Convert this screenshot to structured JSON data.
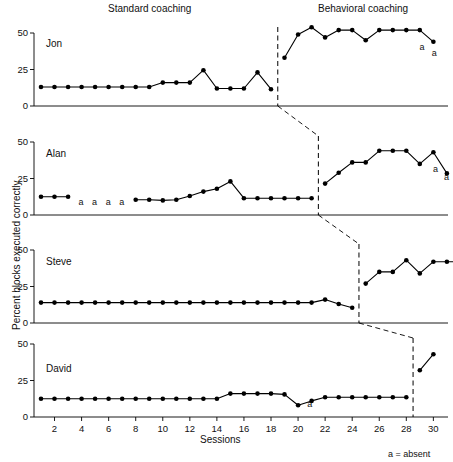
{
  "figure": {
    "phase_titles": [
      {
        "label": "Standard coaching",
        "x": 108,
        "y": 4
      },
      {
        "label": "Behavioral coaching",
        "x": 318,
        "y": 4
      }
    ],
    "y_axis_label": "Percent blocks executed correctly",
    "x_axis_label": "Sessions",
    "legend_note": "a = absent",
    "y_ticks": [
      "0",
      "25",
      "50"
    ],
    "x_ticks": [
      "2",
      "4",
      "6",
      "8",
      "10",
      "12",
      "14",
      "16",
      "18",
      "20",
      "22",
      "24",
      "26",
      "28",
      "30"
    ],
    "colors": {
      "ink": "#000000",
      "background": "#ffffff"
    }
  },
  "chart_data": {
    "type": "line",
    "title": "",
    "xlabel": "Sessions",
    "ylabel": "Percent blocks executed correctly",
    "xlim": [
      0.5,
      30.8
    ],
    "ylim": [
      0,
      55
    ],
    "y_ticks": [
      0,
      25,
      50
    ],
    "x_ticks": [
      2,
      4,
      6,
      8,
      10,
      12,
      14,
      16,
      18,
      20,
      22,
      24,
      26,
      28,
      30
    ],
    "grid": false,
    "legend": "none",
    "design": "multiple-baseline across participants",
    "phases": [
      "Standard coaching",
      "Behavioral coaching"
    ],
    "absent_legend": "a = absent",
    "panels": [
      {
        "name": "Jon",
        "phase_change_x": 18.5,
        "baseline": {
          "x": [
            1,
            2,
            3,
            4,
            5,
            6,
            7,
            8,
            9,
            10,
            11,
            12,
            13,
            14,
            15,
            16,
            17,
            18
          ],
          "y": [
            13,
            13,
            13,
            13,
            13,
            13,
            13,
            13,
            13,
            16,
            16,
            16,
            24.5,
            12,
            12,
            12,
            23,
            11.5
          ]
        },
        "treatment": {
          "x": [
            19,
            20,
            21,
            22,
            23,
            24,
            25,
            26,
            27,
            28,
            29,
            30
          ],
          "y": [
            33,
            49,
            54,
            47,
            52,
            52,
            45,
            52,
            52,
            52,
            52,
            44
          ]
        },
        "absent_marks": [
          {
            "x": 29.2,
            "label": "a"
          },
          {
            "x": 30.1,
            "label": "a"
          }
        ]
      },
      {
        "name": "Alan",
        "phase_change_x": 21.5,
        "baseline": {
          "x": [
            1,
            2,
            3,
            8,
            9,
            10,
            11,
            12,
            13,
            14,
            15,
            16,
            17,
            18,
            19,
            20,
            21
          ],
          "y": [
            12.5,
            12.5,
            12.5,
            10.5,
            10.5,
            10,
            10.5,
            13,
            16,
            18,
            23,
            11.5,
            11.5,
            11.5,
            11.5,
            11.5,
            11.5
          ]
        },
        "treatment": {
          "x": [
            22,
            23,
            24,
            25,
            26,
            27,
            28,
            29,
            30
          ],
          "y": [
            21.5,
            29,
            36,
            36,
            44,
            44,
            44,
            35,
            43
          ]
        },
        "tail": {
          "x": [
            30,
            31
          ],
          "y": [
            43,
            28.5
          ]
        },
        "absent_marks": [
          {
            "x": 4,
            "label": "a"
          },
          {
            "x": 5,
            "label": "a"
          },
          {
            "x": 6,
            "label": "a"
          },
          {
            "x": 7,
            "label": "a"
          },
          {
            "x": 30.2,
            "label": "a"
          },
          {
            "x": 31.0,
            "label": "a"
          }
        ]
      },
      {
        "name": "Steve",
        "phase_change_x": 24.5,
        "baseline": {
          "x": [
            1,
            2,
            3,
            4,
            5,
            6,
            7,
            8,
            9,
            10,
            11,
            12,
            13,
            14,
            15,
            16,
            17,
            18,
            19,
            20,
            21,
            22,
            23,
            24
          ],
          "y": [
            14,
            14,
            14,
            14,
            14,
            14,
            14,
            14,
            14,
            14,
            14,
            14,
            14,
            14,
            14,
            14,
            14,
            14,
            14,
            14,
            14,
            16,
            13,
            10.5
          ]
        },
        "treatment": {
          "x": [
            25,
            26,
            27,
            28,
            29,
            30,
            31,
            32
          ],
          "y": [
            27,
            35,
            35,
            43,
            34,
            42,
            42,
            42
          ]
        },
        "absent_marks": []
      },
      {
        "name": "David",
        "phase_change_x": 28.5,
        "baseline": {
          "x": [
            1,
            2,
            3,
            4,
            5,
            6,
            7,
            8,
            9,
            10,
            11,
            12,
            13,
            14,
            15,
            16,
            17,
            18,
            19,
            20,
            21,
            22,
            23,
            24,
            25,
            26,
            27,
            28
          ],
          "y": [
            12.5,
            12.5,
            12.5,
            12.5,
            12.5,
            12.5,
            12.5,
            12.5,
            12.5,
            12.5,
            12.5,
            12.5,
            12.5,
            12.5,
            16,
            16,
            16,
            16,
            15.5,
            8,
            11,
            13.5,
            13.5,
            13.5,
            13.5,
            13.5,
            13.5,
            13.5
          ]
        },
        "treatment": {
          "x": [
            29,
            30
          ],
          "y": [
            32,
            43
          ]
        },
        "absent_marks": [
          {
            "x": 20.9,
            "label": "a"
          }
        ]
      }
    ]
  }
}
